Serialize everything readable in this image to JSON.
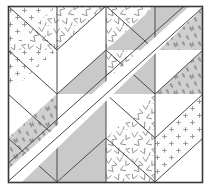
{
  "figure": {
    "type": "geometric-quilt-block",
    "width": 211,
    "height": 189
  },
  "canvas": {
    "background_color": "#ffffff",
    "border_color": "#3a3a3a",
    "border_width": 1,
    "inset_left": 8,
    "inset_top": 6,
    "inset_right": 8,
    "inset_bottom": 6,
    "grid_cols": 4,
    "grid_rows": 4
  },
  "palette": {
    "white": "#ffffff",
    "gray": "#c9c9c9",
    "gray_light": "#d6d6d6",
    "outline": "#4a4a4a",
    "dot_ink": "#8f8f8f",
    "vee_ink": "#8a8a8a",
    "drop_ink": "#9a9a9a",
    "sash_white": "#ffffff"
  },
  "fills": {
    "white": {
      "name": "solid-white",
      "label": "Solid White",
      "color": "#ffffff"
    },
    "gray": {
      "name": "solid-gray",
      "label": "Solid Gray",
      "color": "#c9c9c9"
    },
    "dots": {
      "name": "dot-plus-print",
      "label": "Dotted Plus Print",
      "color": "#fdfdfd"
    },
    "vees": {
      "name": "vee-scatter-print",
      "label": "V Scatter Print",
      "color": "#fdfdfd"
    },
    "drops": {
      "name": "teardrop-print",
      "label": "Teardrop Print on Gray",
      "color": "#cfcfcf"
    }
  },
  "sash": {
    "name": "diagonal-white-sash",
    "label": "Diagonal White Sash",
    "from": "bottom-left",
    "to": "top-right",
    "color": "#ffffff",
    "width": 16
  },
  "patches": [
    {
      "id": "r1c1-upper",
      "row": 1,
      "col": 1,
      "half": "upper-right",
      "fill": "vees"
    },
    {
      "id": "r1c1-lower",
      "row": 1,
      "col": 1,
      "half": "lower-left",
      "fill": "dots"
    },
    {
      "id": "r1c2-upper",
      "row": 1,
      "col": 2,
      "half": "upper-left",
      "fill": "vees"
    },
    {
      "id": "r1c2-lower",
      "row": 1,
      "col": 2,
      "half": "lower-right",
      "fill": "white"
    },
    {
      "id": "r1c3-upper",
      "row": 1,
      "col": 3,
      "half": "upper-right",
      "fill": "gray"
    },
    {
      "id": "r1c3-lower",
      "row": 1,
      "col": 3,
      "half": "lower-left",
      "fill": "vees"
    },
    {
      "id": "r1c4-upper",
      "row": 1,
      "col": 4,
      "half": "upper-left",
      "fill": "gray"
    },
    {
      "id": "r1c4-lower",
      "row": 1,
      "col": 4,
      "half": "lower-right",
      "fill": "drops"
    },
    {
      "id": "r2c1-upper",
      "row": 2,
      "col": 1,
      "half": "upper-right",
      "fill": "dots"
    },
    {
      "id": "r2c1-lower",
      "row": 2,
      "col": 1,
      "half": "lower-left",
      "fill": "white"
    },
    {
      "id": "r2c2-upper",
      "row": 2,
      "col": 2,
      "half": "upper-left",
      "fill": "white"
    },
    {
      "id": "r2c2-lower",
      "row": 2,
      "col": 2,
      "half": "lower-right",
      "fill": "gray"
    },
    {
      "id": "r2c3-upper",
      "row": 2,
      "col": 3,
      "half": "upper-right",
      "fill": "gray"
    },
    {
      "id": "r2c3-lower",
      "row": 2,
      "col": 3,
      "half": "lower-left",
      "fill": "vees"
    },
    {
      "id": "r2c4-upper",
      "row": 2,
      "col": 4,
      "half": "upper-left",
      "fill": "white"
    },
    {
      "id": "r2c4-lower",
      "row": 2,
      "col": 4,
      "half": "lower-right",
      "fill": "drops"
    },
    {
      "id": "r3c1-upper",
      "row": 3,
      "col": 1,
      "half": "upper-right",
      "fill": "white"
    },
    {
      "id": "r3c1-lower",
      "row": 3,
      "col": 1,
      "half": "lower-left",
      "fill": "drops"
    },
    {
      "id": "r3c2-upper",
      "row": 3,
      "col": 2,
      "half": "upper-left",
      "fill": "white"
    },
    {
      "id": "r3c2-lower",
      "row": 3,
      "col": 2,
      "half": "lower-right",
      "fill": "gray"
    },
    {
      "id": "r3c3-upper",
      "row": 3,
      "col": 3,
      "half": "upper-right",
      "fill": "white"
    },
    {
      "id": "r3c3-lower",
      "row": 3,
      "col": 3,
      "half": "lower-left",
      "fill": "vees"
    },
    {
      "id": "r3c4-upper",
      "row": 3,
      "col": 4,
      "half": "upper-left",
      "fill": "white"
    },
    {
      "id": "r3c4-lower",
      "row": 3,
      "col": 4,
      "half": "lower-right",
      "fill": "dots"
    },
    {
      "id": "r4c1-upper",
      "row": 4,
      "col": 1,
      "half": "upper-right",
      "fill": "drops"
    },
    {
      "id": "r4c1-lower",
      "row": 4,
      "col": 1,
      "half": "lower-left",
      "fill": "gray"
    },
    {
      "id": "r4c2-upper",
      "row": 4,
      "col": 2,
      "half": "upper-left",
      "fill": "gray"
    },
    {
      "id": "r4c2-lower",
      "row": 4,
      "col": 2,
      "half": "lower-right",
      "fill": "gray"
    },
    {
      "id": "r4c3-upper",
      "row": 4,
      "col": 3,
      "half": "upper-right",
      "fill": "vees"
    },
    {
      "id": "r4c3-lower",
      "row": 4,
      "col": 3,
      "half": "lower-left",
      "fill": "vees"
    },
    {
      "id": "r4c4-upper",
      "row": 4,
      "col": 4,
      "half": "upper-left",
      "fill": "dots"
    },
    {
      "id": "r4c4-lower",
      "row": 4,
      "col": 4,
      "half": "lower-right",
      "fill": "white"
    }
  ]
}
